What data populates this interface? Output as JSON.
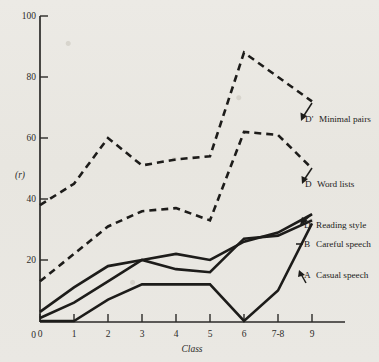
{
  "chart_data": {
    "type": "line",
    "title": "",
    "xlabel": "Class",
    "ylabel": "(r)",
    "x": [
      0,
      1,
      2,
      3,
      4,
      5,
      6,
      7,
      8
    ],
    "categories": [
      "0",
      "1",
      "2",
      "3",
      "4",
      "5",
      "6",
      "7-8",
      "9"
    ],
    "xlim": [
      0,
      8
    ],
    "ylim": [
      0,
      100
    ],
    "ytick_labels": [
      "0",
      "20",
      "40",
      "60",
      "80",
      "100"
    ],
    "ytick_values": [
      0,
      20,
      40,
      60,
      80,
      100
    ],
    "grid": false,
    "legend_position": "right-inline",
    "series": [
      {
        "name": "D' Minimal pairs",
        "key": "D'",
        "label": "Minimal pairs",
        "style": "dashed",
        "values": [
          38,
          45,
          60,
          51,
          53,
          54,
          88,
          80,
          72
        ]
      },
      {
        "name": "D Word lists",
        "key": "D",
        "label": "Word lists",
        "style": "dashed",
        "values": [
          13,
          22,
          31,
          36,
          37,
          33,
          62,
          61,
          50
        ]
      },
      {
        "name": "D Reading style",
        "key": "D",
        "label": "Reading style",
        "style": "solid",
        "values": [
          3,
          11,
          18,
          20,
          22,
          20,
          26,
          29,
          35
        ]
      },
      {
        "name": "B Careful speech",
        "key": "B",
        "label": "Careful speech",
        "style": "solid",
        "values": [
          1,
          6,
          13,
          20,
          17,
          16,
          27,
          28,
          33
        ]
      },
      {
        "name": "A Casual speech",
        "key": "A",
        "label": "Casual speech",
        "style": "solid",
        "values": [
          0,
          0,
          7,
          12,
          12,
          12,
          0,
          10,
          32
        ]
      }
    ]
  },
  "legend": {
    "entries": [
      {
        "key": "D'",
        "label": "Minimal pairs"
      },
      {
        "key": "D",
        "label": "Word lists"
      },
      {
        "key": "D",
        "label": "Reading style"
      },
      {
        "key": "B",
        "label": "Careful speech"
      },
      {
        "key": "A",
        "label": "Casual speech"
      }
    ]
  },
  "axes": {
    "x_title": "Class",
    "y_title": "(r)"
  }
}
